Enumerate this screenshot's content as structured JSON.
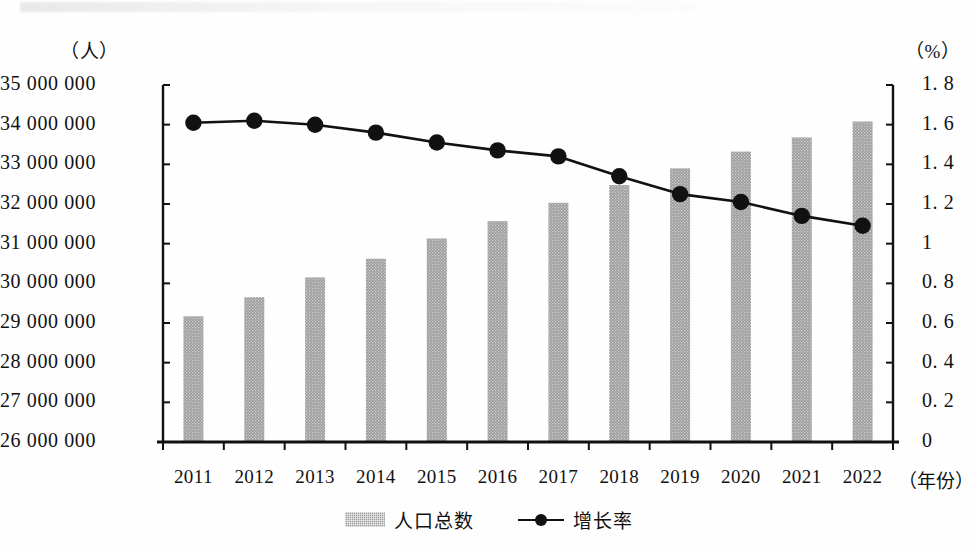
{
  "chart_data": {
    "type": "bar",
    "title": "",
    "subtitle": "",
    "xlabel": "年份",
    "ylabel": "人",
    "y2label": "%",
    "categories": [
      "2011",
      "2012",
      "2013",
      "2014",
      "2015",
      "2016",
      "2017",
      "2018",
      "2019",
      "2020",
      "2021",
      "2022"
    ],
    "series": [
      {
        "name": "人口总数",
        "type": "bar",
        "axis": "left",
        "unit": "人",
        "color": "#9a9a9a",
        "values": [
          29170000,
          29650000,
          30150000,
          30620000,
          31130000,
          31570000,
          32030000,
          32480000,
          32900000,
          33320000,
          33680000,
          34080000
        ]
      },
      {
        "name": "增长率",
        "type": "line",
        "axis": "right",
        "unit": "%",
        "color": "#111111",
        "values": [
          1.61,
          1.62,
          1.6,
          1.56,
          1.51,
          1.47,
          1.44,
          1.34,
          1.25,
          1.21,
          1.14,
          1.09
        ]
      }
    ],
    "ylim": [
      26000000,
      35000000
    ],
    "y2lim": [
      0,
      1.8
    ],
    "yticks": [
      26000000,
      27000000,
      28000000,
      29000000,
      30000000,
      31000000,
      32000000,
      33000000,
      34000000,
      35000000
    ],
    "ytick_labels": [
      "26 000 000",
      "27 000 000",
      "28 000 000",
      "29 000 000",
      "30 000 000",
      "31 000 000",
      "32 000 000",
      "33 000 000",
      "34 000 000",
      "35 000 000"
    ],
    "y2ticks": [
      0,
      0.2,
      0.4,
      0.6,
      0.8,
      1.0,
      1.2,
      1.4,
      1.6,
      1.8
    ],
    "y2tick_labels": [
      "0",
      "0. 2",
      "0. 4",
      "0. 6",
      "0. 8",
      "1",
      "1. 2",
      "1. 4",
      "1. 6",
      "1. 8"
    ],
    "grid": false,
    "legend_position": "bottom"
  },
  "axes": {
    "left_unit_label": "（人）",
    "right_unit_label": "（%）",
    "x_axis_title": "（年份）"
  },
  "legend": {
    "items": [
      {
        "label": "人口总数",
        "marker": "bar-swatch"
      },
      {
        "label": "增长率",
        "marker": "line-dot-swatch"
      }
    ]
  }
}
